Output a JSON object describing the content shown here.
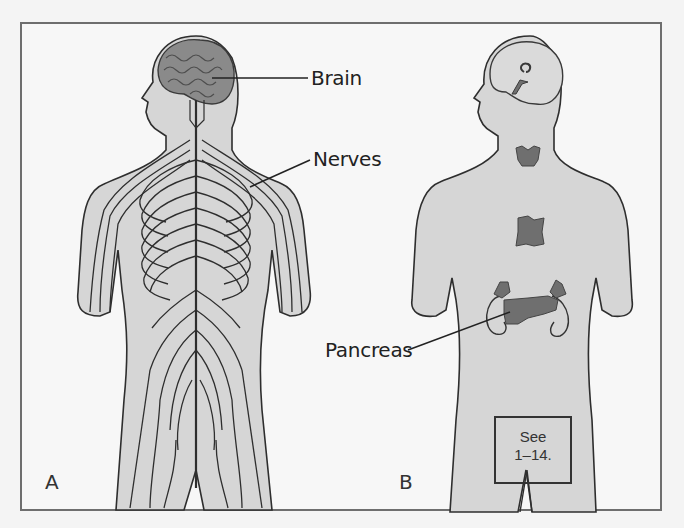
{
  "figure": {
    "panels": [
      {
        "id": "A",
        "label": "A",
        "subject": "nervous system"
      },
      {
        "id": "B",
        "label": "B",
        "subject": "endocrine system"
      }
    ],
    "callouts": {
      "brain": "Brain",
      "nerves": "Nerves",
      "pancreas": "Pancreas"
    },
    "reference_box": {
      "line1": "See",
      "line2": "1–14."
    }
  },
  "colors": {
    "body_fill": "#d6d6d6",
    "outline": "#2e2e2e",
    "organ_fill": "#6f6f6f",
    "brain_fill": "#8a8a8a",
    "brain_fill_light": "#dadada",
    "frame": "#6e6e6e",
    "background": "#f7f7f7"
  }
}
